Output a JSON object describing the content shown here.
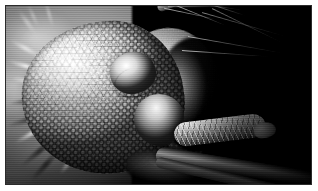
{
  "image": {
    "kind": "scanning-electron-micrograph",
    "subject": "Mosquito head (Culicidae) in lateral view",
    "title": "SEM of mosquito head showing compound eye, antenna and proboscis",
    "background_color": "#000000",
    "frame": {
      "mat_color": "#ffffff",
      "border_color": "#2b2b2b",
      "border_width_px": 1,
      "mat_width_px": 5
    },
    "palette": {
      "highlight": "#f3f3f3",
      "midtone": "#9b9b9b",
      "shadow": "#3a3a3a",
      "black": "#010101"
    },
    "rendering": "monochrome / grayscale"
  },
  "features": [
    {
      "id": "compound-eye",
      "label": "Compound eye",
      "description": "Large dome covered in a regular hexagonal lattice of ommatidia facets",
      "position": "left-center",
      "tone": "bright gray"
    },
    {
      "id": "antennal-pedicel",
      "label": "Antennal pedicel",
      "description": "Smooth bulbous segment housing Johnston's organ",
      "position": "upper-center",
      "tone": "bright"
    },
    {
      "id": "antenna-flagellum",
      "label": "Antenna flagellum",
      "description": "Segmented shaft extending to upper right with long whorl setae",
      "position": "upper-right",
      "tone": "bright on black"
    },
    {
      "id": "clypeus",
      "label": "Clypeus",
      "description": "Rounded frontal plate below the pedicel",
      "position": "center",
      "tone": "mid gray"
    },
    {
      "id": "maxillary-palp",
      "label": "Maxillary palp",
      "description": "Scale-covered club-shaped appendage directed to the right",
      "position": "lower-right",
      "tone": "mid-bright"
    },
    {
      "id": "proboscis",
      "label": "Proboscis",
      "description": "Long dark tubular mouthpart sweeping to the lower right corner",
      "position": "bottom-right",
      "tone": "dark gray"
    },
    {
      "id": "thoracic-scales",
      "label": "Out-of-focus scales and setae",
      "description": "Blurred bristles and scales of the body filling the left margin",
      "position": "left-edge",
      "tone": "mid gray, defocused"
    }
  ]
}
